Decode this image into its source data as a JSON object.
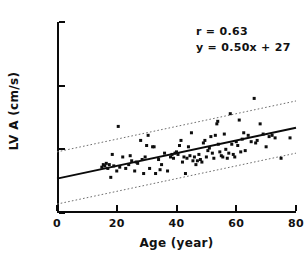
{
  "chart_data": {
    "type": "scatter",
    "title": "",
    "xlabel": "Age (year)",
    "ylabel": "LV A (cm/s)",
    "xlim": [
      0,
      80
    ],
    "ylim": [
      0,
      150
    ],
    "xticks": [
      0,
      20,
      40,
      60,
      80
    ],
    "yticks": [
      0,
      50,
      100,
      150
    ],
    "grid": false,
    "legend": null,
    "annotations": {
      "correlation": "r = 0.63",
      "equation": "y = 0.50x + 27"
    },
    "regression": {
      "slope": 0.5,
      "intercept": 27,
      "r": 0.63,
      "x_start": 0,
      "y_start": 27,
      "x_end": 80,
      "y_end": 67,
      "style": "solid"
    },
    "bands": [
      {
        "name": "upper-prediction-band",
        "slope": 0.5,
        "intercept": 48,
        "x_start": 0,
        "y_start": 48,
        "x_end": 80,
        "y_end": 88,
        "style": "dotted"
      },
      {
        "name": "lower-prediction-band",
        "slope": 0.5,
        "intercept": 7,
        "x_start": 0,
        "y_start": 7,
        "x_end": 80,
        "y_end": 47,
        "style": "dotted"
      }
    ],
    "marker": {
      "shape": "square",
      "color": "#0d0d0d",
      "size": 3
    },
    "points": [
      [
        15,
        36
      ],
      [
        15.5,
        38
      ],
      [
        16,
        37
      ],
      [
        16.5,
        39
      ],
      [
        17,
        35
      ],
      [
        17.5,
        38
      ],
      [
        18,
        28
      ],
      [
        18.5,
        46
      ],
      [
        19,
        37
      ],
      [
        20,
        33
      ],
      [
        20.5,
        68
      ],
      [
        21,
        36
      ],
      [
        22,
        44
      ],
      [
        23,
        35
      ],
      [
        24,
        38
      ],
      [
        24.5,
        45
      ],
      [
        25,
        41
      ],
      [
        26,
        33
      ],
      [
        26.5,
        40
      ],
      [
        27,
        39
      ],
      [
        28,
        57
      ],
      [
        28.5,
        42
      ],
      [
        29,
        31
      ],
      [
        29.5,
        44
      ],
      [
        30,
        53
      ],
      [
        30.5,
        61
      ],
      [
        31,
        35
      ],
      [
        32,
        52
      ],
      [
        32.5,
        52
      ],
      [
        33,
        31
      ],
      [
        34,
        42
      ],
      [
        34.5,
        34
      ],
      [
        35,
        38
      ],
      [
        36,
        47
      ],
      [
        37,
        33
      ],
      [
        38,
        44
      ],
      [
        38.5,
        46
      ],
      [
        39,
        43
      ],
      [
        39.5,
        47
      ],
      [
        40,
        48
      ],
      [
        40.5,
        46
      ],
      [
        41,
        53
      ],
      [
        41.5,
        57
      ],
      [
        42,
        40
      ],
      [
        42.5,
        44
      ],
      [
        43,
        31
      ],
      [
        43.5,
        43
      ],
      [
        44,
        52
      ],
      [
        44.5,
        45
      ],
      [
        45,
        63
      ],
      [
        45.5,
        41
      ],
      [
        46,
        44
      ],
      [
        46.5,
        38
      ],
      [
        47,
        41
      ],
      [
        47.5,
        46
      ],
      [
        48,
        42
      ],
      [
        48.5,
        40
      ],
      [
        49,
        55
      ],
      [
        49.5,
        57
      ],
      [
        50,
        44
      ],
      [
        50.5,
        49
      ],
      [
        51,
        51
      ],
      [
        51.5,
        60
      ],
      [
        52,
        47
      ],
      [
        52.5,
        43
      ],
      [
        53,
        61
      ],
      [
        53.5,
        70
      ],
      [
        53.8,
        72
      ],
      [
        54,
        54
      ],
      [
        54.5,
        48
      ],
      [
        55,
        45
      ],
      [
        55.5,
        44
      ],
      [
        56,
        62
      ],
      [
        56.5,
        50
      ],
      [
        57,
        43
      ],
      [
        57.5,
        47
      ],
      [
        58,
        78
      ],
      [
        58.5,
        54
      ],
      [
        59,
        46
      ],
      [
        59.5,
        44
      ],
      [
        60,
        56
      ],
      [
        60.5,
        53
      ],
      [
        61,
        73
      ],
      [
        61.5,
        48
      ],
      [
        62,
        58
      ],
      [
        62.5,
        63
      ],
      [
        63,
        49
      ],
      [
        64,
        61
      ],
      [
        65,
        56
      ],
      [
        66,
        90
      ],
      [
        66.5,
        55
      ],
      [
        67,
        57
      ],
      [
        68,
        70
      ],
      [
        69,
        62
      ],
      [
        70,
        52
      ],
      [
        71,
        60
      ],
      [
        72,
        61
      ],
      [
        73,
        59
      ],
      [
        75,
        43
      ],
      [
        78,
        59
      ]
    ]
  }
}
